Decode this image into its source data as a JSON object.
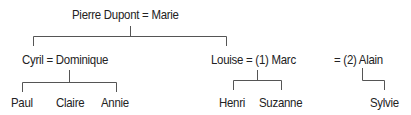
{
  "diagram": {
    "type": "family-tree",
    "colors": {
      "text": "#222222",
      "line": "#555555",
      "background": "#ffffff"
    },
    "couples": {
      "root": "Pierre Dupont = Marie",
      "cyril": "Cyril = Dominique",
      "louise": "Louise = (1) Marc",
      "alain": "= (2) Alain"
    },
    "children": {
      "cyril": [
        "Paul",
        "Claire",
        "Annie"
      ],
      "louise_marc": [
        "Henri",
        "Suzanne"
      ],
      "louise_alain": [
        "Sylvie"
      ]
    }
  }
}
